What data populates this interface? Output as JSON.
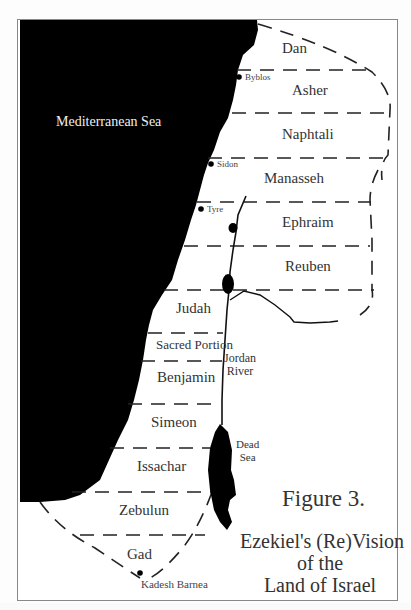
{
  "figure": {
    "number_label": "Figure 3.",
    "title_line1": "Ezekiel's (Re)Vision",
    "title_line2": "of the",
    "title_line3": "Land of Israel"
  },
  "sea": {
    "label": "Mediterranean Sea",
    "color": "#000000"
  },
  "tribes": [
    {
      "name": "Dan"
    },
    {
      "name": "Asher"
    },
    {
      "name": "Naphtali"
    },
    {
      "name": "Manasseh"
    },
    {
      "name": "Ephraim"
    },
    {
      "name": "Reuben"
    },
    {
      "name": "Judah"
    },
    {
      "name": "Sacred Portion"
    },
    {
      "name": "Benjamin"
    },
    {
      "name": "Simeon"
    },
    {
      "name": "Issachar"
    },
    {
      "name": "Zebulun"
    },
    {
      "name": "Gad"
    }
  ],
  "cities": [
    {
      "name": "Byblos"
    },
    {
      "name": "Sidon"
    },
    {
      "name": "Tyre"
    },
    {
      "name": "Kadesh Barnea"
    }
  ],
  "water_features": {
    "river_line1": "Jordan",
    "river_line2": "River",
    "dead_sea_line1": "Dead",
    "dead_sea_line2": "Sea"
  }
}
